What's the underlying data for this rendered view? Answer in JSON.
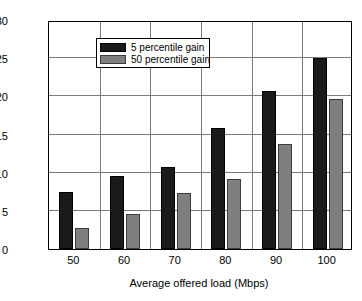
{
  "chart_data": {
    "type": "bar",
    "title": "",
    "xlabel": "Average offered load (Mbps)",
    "ylabel": "User throughput gain (%)",
    "categories": [
      "50",
      "60",
      "70",
      "80",
      "90",
      "100"
    ],
    "series": [
      {
        "name": "5 percentile gain",
        "color": "#1a1a1a",
        "values": [
          7.5,
          9.6,
          10.7,
          15.8,
          20.7,
          25.0
        ]
      },
      {
        "name": "50 percentile gain",
        "color": "#7f7f7f",
        "values": [
          2.8,
          4.6,
          7.4,
          9.2,
          13.8,
          19.7
        ]
      }
    ],
    "ylim": [
      0,
      30
    ],
    "yticks": [
      "0",
      "5",
      "10",
      "15",
      "20",
      "25",
      "30"
    ],
    "ytick_values": [
      0,
      5,
      10,
      15,
      20,
      25,
      30
    ],
    "xticks": [
      "50",
      "60",
      "70",
      "80",
      "90",
      "100"
    ],
    "grid": true,
    "legend_position": "upper left"
  },
  "legend": {
    "entries": [
      {
        "label": "5 percentile gain"
      },
      {
        "label": "50 percentile gain"
      }
    ]
  }
}
